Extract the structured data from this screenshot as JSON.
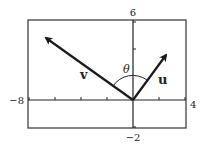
{
  "diagram": {
    "title": "",
    "viewing_window": {
      "xmin": -8,
      "xmax": 4,
      "ymin": -2,
      "ymax": 6
    },
    "axis_labels": {
      "ymax": "6",
      "ymin": "−2",
      "xmin": "−8",
      "xmax": "4"
    },
    "vectors": [
      {
        "name": "v",
        "label": "v",
        "from": [
          0,
          0
        ],
        "to": [
          -7,
          5
        ]
      },
      {
        "name": "u",
        "label": "u",
        "from": [
          0,
          0
        ],
        "to": [
          3,
          4
        ]
      }
    ],
    "angle_label": "θ",
    "colors": {
      "stroke": "#1a1a1a",
      "background": "#ffffff"
    }
  }
}
